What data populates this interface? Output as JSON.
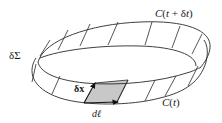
{
  "figure": {
    "labels": {
      "top_curve": "C(t + δt)",
      "bottom_curve": "C(t)",
      "surface": "δΣ",
      "displacement": "δx",
      "line_element": "dℓ"
    },
    "colors": {
      "stroke": "#2a2a2a",
      "patch_fill": "#c8c8c8",
      "background": "#ffffff"
    }
  }
}
